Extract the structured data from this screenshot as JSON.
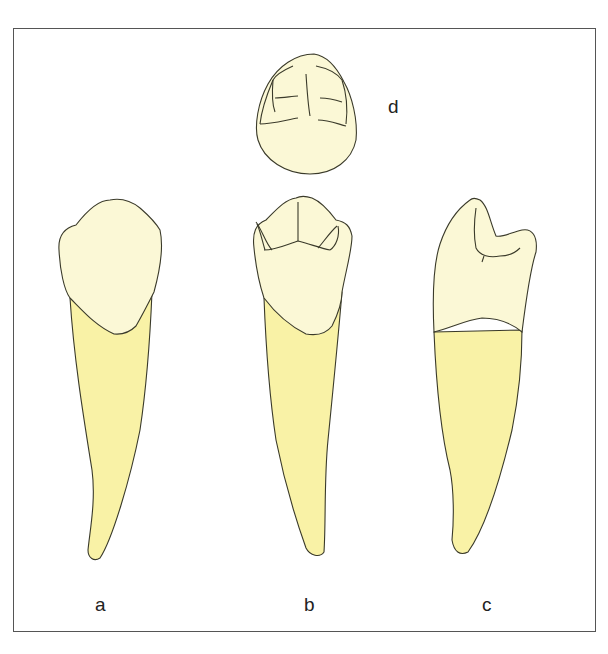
{
  "figure": {
    "labels": {
      "a": "a",
      "b": "b",
      "c": "c",
      "d": "d"
    },
    "views": [
      {
        "id": "a",
        "description": "labial view of tooth"
      },
      {
        "id": "b",
        "description": "lingual view of tooth"
      },
      {
        "id": "c",
        "description": "proximal view of tooth"
      },
      {
        "id": "d",
        "description": "incisal/occlusal view of crown"
      }
    ],
    "colors": {
      "crown": "#fbf8d6",
      "root": "#f9f2a6",
      "outline": "#3a3a2a",
      "frame": "#555555"
    }
  }
}
